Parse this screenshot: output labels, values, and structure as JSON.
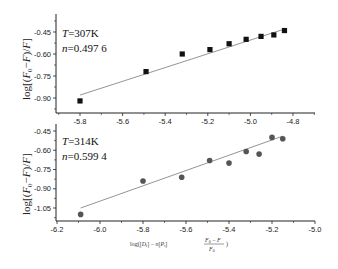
{
  "chart_data": [
    {
      "type": "scatter",
      "panel": "top",
      "annotation": {
        "T": "T=307K",
        "n": "n=0.497 6"
      },
      "ylabel": "log[(F0−F)/F]",
      "xlabel": "",
      "xlim": [
        -5.9,
        -4.7
      ],
      "ylim": [
        -0.98,
        -0.38
      ],
      "xticks": [
        -5.8,
        -5.6,
        -5.4,
        -5.2,
        -5.0,
        -4.8
      ],
      "xtick_labels": [
        "-5.8",
        "-5.6",
        "-5.4",
        "-5.2",
        "-5.0",
        "-4.8"
      ],
      "yticks": [
        -0.45,
        -0.6,
        -0.75,
        -0.9
      ],
      "ytick_labels": [
        "-0.45",
        "-0.60",
        "-0.75",
        "-0.90"
      ],
      "marker": "square",
      "marker_color": "#111111",
      "fit_line_color": "#888888",
      "series": [
        {
          "name": "T=307K",
          "x": [
            -5.8,
            -5.49,
            -5.32,
            -5.19,
            -5.1,
            -5.02,
            -4.95,
            -4.89,
            -4.84
          ],
          "y": [
            -0.92,
            -0.72,
            -0.6,
            -0.57,
            -0.53,
            -0.5,
            -0.48,
            -0.47,
            -0.44
          ]
        }
      ],
      "fit": {
        "x": [
          -5.8,
          -4.84
        ],
        "y": [
          -0.88,
          -0.43
        ]
      },
      "grid": false
    },
    {
      "type": "scatter",
      "panel": "bottom",
      "annotation": {
        "T": "T=314K",
        "n": "n=0.599 4"
      },
      "ylabel": "log[(F0−F)/F]",
      "xlabel": "log([Dt] − n[Pt](F0 − F)/F0)",
      "xlim": [
        -6.2,
        -5.0
      ],
      "ylim": [
        -1.15,
        -0.4
      ],
      "xticks": [
        -6.2,
        -6.0,
        -5.8,
        -5.6,
        -5.4,
        -5.2,
        -5.0
      ],
      "xtick_labels": [
        "-6.2",
        "-6.0",
        "-5.8",
        "-5.6",
        "-5.4",
        "-5.2",
        "-5.0"
      ],
      "yticks": [
        -0.45,
        -0.6,
        -0.75,
        -0.9,
        -1.05
      ],
      "ytick_labels": [
        "-0.45",
        "-0.60",
        "-0.75",
        "-0.90",
        "-1.05"
      ],
      "marker": "circle",
      "marker_color": "#555555",
      "fit_line_color": "#888888",
      "series": [
        {
          "name": "T=314K",
          "x": [
            -6.09,
            -5.8,
            -5.62,
            -5.49,
            -5.4,
            -5.32,
            -5.26,
            -5.2,
            -5.15
          ],
          "y": [
            -1.1,
            -0.84,
            -0.81,
            -0.68,
            -0.7,
            -0.61,
            -0.63,
            -0.5,
            -0.51
          ]
        }
      ],
      "fit": {
        "x": [
          -6.09,
          -5.15
        ],
        "y": [
          -1.05,
          -0.49
        ]
      },
      "grid": false
    }
  ],
  "labels": {
    "top_T": "T",
    "top_T_val": "=307K",
    "top_n": "n",
    "top_n_val": "=0.497 6",
    "bot_T": "T",
    "bot_T_val": "=314K",
    "bot_n": "n",
    "bot_n_val": "=0.599 4",
    "ylabel": "log[(F",
    "xlabel": "log([Dt] − n[Pt]·(F0−F)/F0)"
  }
}
